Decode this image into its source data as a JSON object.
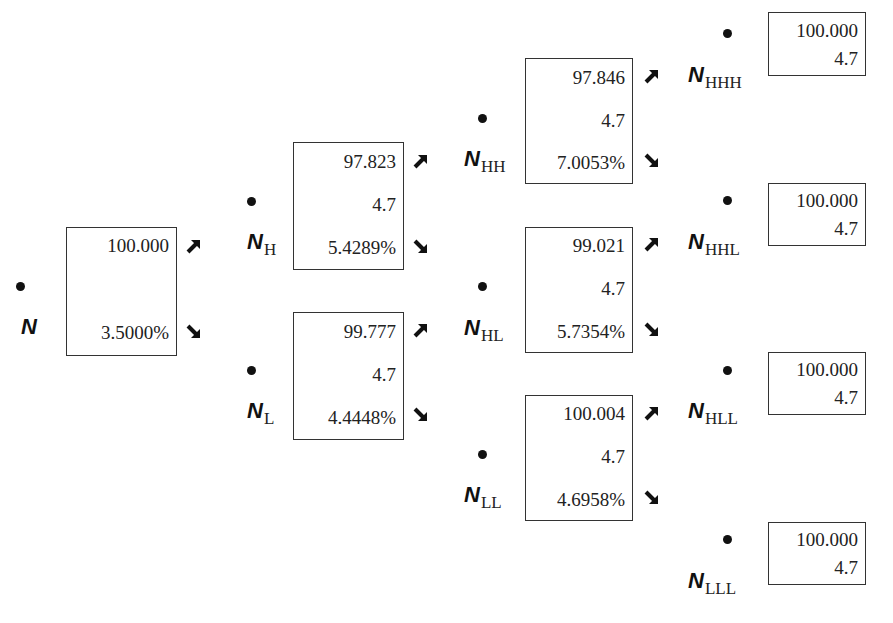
{
  "diagram": {
    "type": "binomial-interest-rate-tree",
    "nodes": [
      {
        "id": "N",
        "label": "N",
        "subscript": "",
        "value": "100.000",
        "coupon": "",
        "rate": "3.5000%"
      },
      {
        "id": "NH",
        "label": "N",
        "subscript": "H",
        "value": "97.823",
        "coupon": "4.7",
        "rate": "5.4289%"
      },
      {
        "id": "NL",
        "label": "N",
        "subscript": "L",
        "value": "99.777",
        "coupon": "4.7",
        "rate": "4.4448%"
      },
      {
        "id": "NHH",
        "label": "N",
        "subscript": "HH",
        "value": "97.846",
        "coupon": "4.7",
        "rate": "7.0053%"
      },
      {
        "id": "NHL",
        "label": "N",
        "subscript": "HL",
        "value": "99.021",
        "coupon": "4.7",
        "rate": "5.7354%"
      },
      {
        "id": "NLL",
        "label": "N",
        "subscript": "LL",
        "value": "100.004",
        "coupon": "4.7",
        "rate": "4.6958%"
      },
      {
        "id": "NHHH",
        "label": "N",
        "subscript": "HHH",
        "value": "100.000",
        "coupon": "4.7"
      },
      {
        "id": "NHHL",
        "label": "N",
        "subscript": "HHL",
        "value": "100.000",
        "coupon": "4.7"
      },
      {
        "id": "NHLL",
        "label": "N",
        "subscript": "HLL",
        "value": "100.000",
        "coupon": "4.7"
      },
      {
        "id": "NLLL",
        "label": "N",
        "subscript": "LLL",
        "value": "100.000",
        "coupon": "4.7"
      }
    ],
    "icons": {
      "up_arrow": "arrow-up-right-icon",
      "down_arrow": "arrow-down-right-icon",
      "node_marker": "node-dot-icon"
    }
  }
}
